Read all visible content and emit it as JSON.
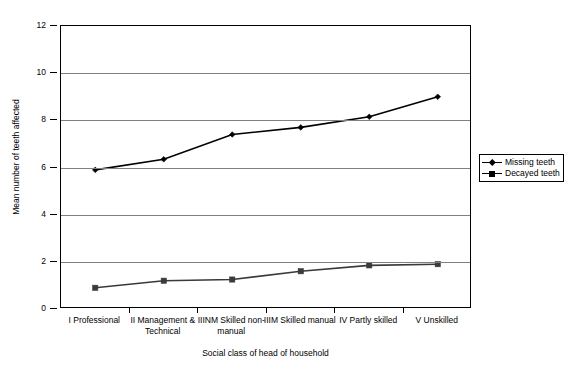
{
  "chart_data": {
    "type": "line",
    "title": "",
    "xlabel": "Social class of head of household",
    "ylabel": "Mean number of teeth affected",
    "categories": [
      "I Professional",
      "II Management & Technical",
      "IIINM Skilled non-manual",
      "IIIM Skilled manual",
      "IV Partly skilled",
      "V Unskilled"
    ],
    "series": [
      {
        "name": "Missing teeth",
        "marker": "diamond",
        "color": "#000000",
        "values": [
          5.9,
          6.35,
          7.4,
          7.7,
          8.15,
          9.0
        ]
      },
      {
        "name": "Decayed teeth",
        "marker": "square",
        "color": "#3a3a3a",
        "values": [
          0.9,
          1.2,
          1.25,
          1.6,
          1.85,
          1.9
        ]
      }
    ],
    "ylim": [
      0,
      12
    ],
    "yticks": [
      0,
      2,
      4,
      6,
      8,
      10,
      12
    ],
    "ytick_labels": [
      "0",
      "2",
      "4",
      "6",
      "8",
      "10",
      "12"
    ],
    "grid": true,
    "legend_position": "right"
  },
  "legend": {
    "entries": [
      {
        "label": "Missing teeth"
      },
      {
        "label": "Decayed teeth"
      }
    ]
  }
}
